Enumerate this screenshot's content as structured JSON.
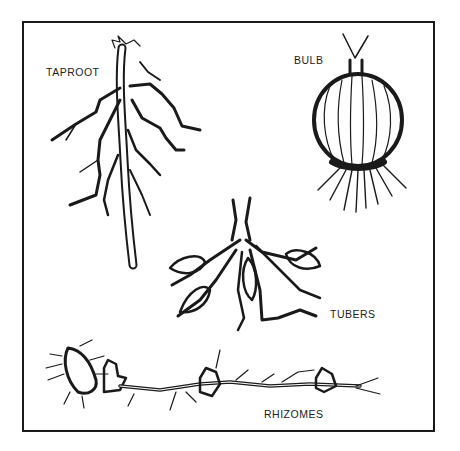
{
  "figure": {
    "labels": {
      "taproot": "TAPROOT",
      "bulb": "BULB",
      "tubers": "TUBERS",
      "rhizomes": "RHIZOMES"
    },
    "ink_color": "#1a1a1a",
    "background": "#ffffff"
  }
}
